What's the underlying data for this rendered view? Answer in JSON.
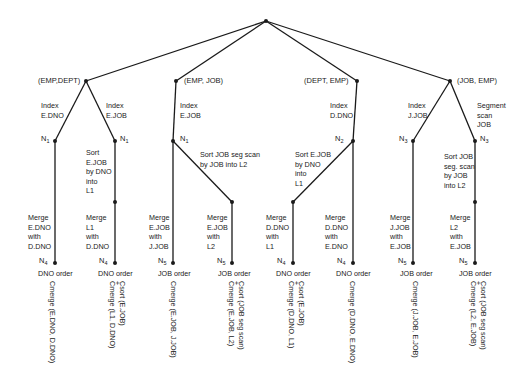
{
  "level1": [
    {
      "id": "emp-dept",
      "label": "(EMP,DEPT)"
    },
    {
      "id": "emp-job",
      "label": "(EMP, JOB)"
    },
    {
      "id": "dept-emp",
      "label": "(DEPT, EMP)"
    },
    {
      "id": "job-emp",
      "label": "(JOB, EMP)"
    }
  ],
  "edges_level2": [
    {
      "label": "Index\nE.DNO"
    },
    {
      "label": "Index\nE.JOB"
    },
    {
      "label": "Index\nE.JOB"
    },
    {
      "label": "Index\nD.DNO"
    },
    {
      "label": "Index\nJ.JOB"
    },
    {
      "label": "Segment\nscan\nJOB"
    }
  ],
  "n_nodes": [
    "N1",
    "N1",
    "N1",
    "N2",
    "N3",
    "N3"
  ],
  "sort_steps": [
    {
      "label": "Sort\nE.JOB\nby DNO\ninto\nL1"
    },
    {
      "label": "Sort JOB seg scan\nby JOB into L2"
    },
    {
      "label": "Sort E.JOB\nby DNO\ninto\nL1"
    },
    {
      "label": "Sort JOB\nseg. scan\nby JOB\ninto L2"
    }
  ],
  "merges": [
    {
      "label": "Merge\nE.DNO\nwith\nD.DNO"
    },
    {
      "label": "Merge\nL1\nwith\nD.DNO"
    },
    {
      "label": "Merge\nE.JOB\nwith\nJ.JOB"
    },
    {
      "label": "Merge\nE.JOB\nwith\nL2"
    },
    {
      "label": "Merge\nD.DNO\nwith\nL1"
    },
    {
      "label": "Merge\nD.DNO\nwith\nE.DNO"
    },
    {
      "label": "Merge\nJ.JOB\nwith\nE.JOB"
    },
    {
      "label": "Merge\nL2\nwith\nE.JOB"
    }
  ],
  "leaves": [
    {
      "node": "N4",
      "order": "DNO order",
      "cost": [
        "Cmerge (E.DNO, D.DNO)"
      ]
    },
    {
      "node": "N4",
      "order": "DNO order",
      "cost": [
        "Csort (E.JOB)",
        "+",
        "Cmerge (L1, D.DNO)"
      ]
    },
    {
      "node": "N5",
      "order": "JOB order",
      "cost": [
        "Cmerge (E.JOB, J.JOB)"
      ]
    },
    {
      "node": "N5",
      "order": "JOB order",
      "cost": [
        "Csort (JOB seg scan)",
        "+",
        "Cmerge (E.JOB, L2)"
      ]
    },
    {
      "node": "N4",
      "order": "DNO order",
      "cost": [
        "Csort (E.JOB)",
        "+",
        "Cmerge (D.DNO, L1)"
      ]
    },
    {
      "node": "N4",
      "order": "DNO order",
      "cost": [
        "Cmerge (D.DNO, E.DNO)"
      ]
    },
    {
      "node": "N5",
      "order": "JOB order",
      "cost": [
        "Cmerge (J.JOB, E.JOB)"
      ]
    },
    {
      "node": "N5",
      "order": "JOB order",
      "cost": [
        "Csort (JOB seg scan)",
        "+",
        "Cmerge (L2, E.JOB)"
      ]
    }
  ]
}
